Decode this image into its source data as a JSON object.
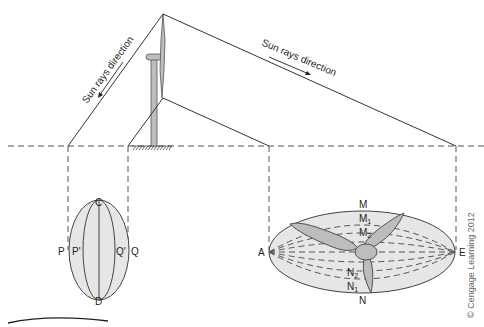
{
  "diagram": {
    "sun_label_left": "Sun rays direction",
    "sun_label_right": "Sun rays direction",
    "small_ellipse_labels": {
      "top": "C",
      "bottom": "D",
      "left_outer": "P",
      "left_inner": "P'",
      "right_inner": "Q'",
      "right_outer": "Q"
    },
    "large_ellipse_labels": {
      "left": "A",
      "right": "E",
      "top": "M",
      "m1": "M",
      "m1_sub": "1",
      "m2": "M",
      "m2_sub": "2",
      "n2": "N",
      "n2_sub": "2",
      "n1": "N",
      "n1_sub": "1",
      "bottom": "N"
    },
    "copyright": "© Cengage Learning 2012",
    "colors": {
      "line": "#333333",
      "fill": "#e6e6e6",
      "tower": "#bdbdbd"
    }
  }
}
